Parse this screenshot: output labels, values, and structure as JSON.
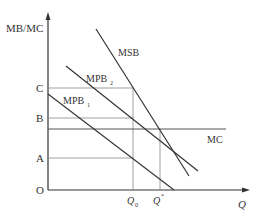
{
  "diagram": {
    "type": "economics-externality",
    "y_axis_label": "MB/MC",
    "x_axis_label": "Q",
    "origin_label": "O",
    "y_levels": [
      {
        "label": "C",
        "y": 88
      },
      {
        "label": "B",
        "y": 118
      },
      {
        "label": "A",
        "y": 158
      }
    ],
    "x_points": [
      {
        "label": "Q",
        "sub": "0",
        "x": 133
      },
      {
        "label": "Q",
        "sup": "*",
        "x": 160
      }
    ],
    "curves": [
      {
        "name": "MSB",
        "label": "MSB"
      },
      {
        "name": "MPB2",
        "label": "MPB",
        "sub": "2"
      },
      {
        "name": "MPB1",
        "label": "MPB",
        "sub": "1"
      },
      {
        "name": "MC",
        "label": "MC"
      }
    ],
    "colors": {
      "line": "#333333",
      "guide": "#888888"
    }
  }
}
